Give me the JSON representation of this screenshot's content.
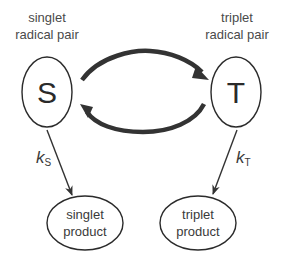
{
  "diagram": {
    "nodes": {
      "singlet_pair": {
        "label_line1": "singlet",
        "label_line2": "radical pair",
        "symbol": "S"
      },
      "triplet_pair": {
        "label_line1": "triplet",
        "label_line2": "radical pair",
        "symbol": "T"
      },
      "singlet_product": {
        "line1": "singlet",
        "line2": "product"
      },
      "triplet_product": {
        "line1": "triplet",
        "line2": "product"
      }
    },
    "edges": {
      "interconversion_forward": {
        "from": "S",
        "to": "T"
      },
      "interconversion_backward": {
        "from": "T",
        "to": "S"
      },
      "singlet_decay": {
        "rate_symbol": "k",
        "rate_subscript": "S"
      },
      "triplet_decay": {
        "rate_symbol": "k",
        "rate_subscript": "T"
      }
    },
    "colors": {
      "stroke": "#2b2b2b",
      "arc": "#333333",
      "text": "#3a3a3a",
      "background": "#ffffff"
    }
  }
}
